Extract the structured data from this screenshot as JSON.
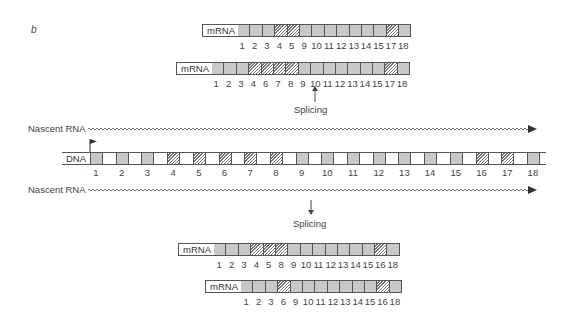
{
  "panel_label": "b",
  "labels": {
    "mrna": "mRNA",
    "dna": "DNA",
    "nascent_rna": "Nascent RNA",
    "splicing": "Splicing"
  },
  "colors": {
    "constitutive_exon": "#c8c8c8",
    "alternative_exon": "hatched",
    "outline": "#555555"
  },
  "dna": {
    "exons": [
      {
        "n": "1",
        "type": "solid"
      },
      {
        "n": "2",
        "type": "solid"
      },
      {
        "n": "3",
        "type": "solid"
      },
      {
        "n": "4",
        "type": "hatch"
      },
      {
        "n": "5",
        "type": "hatch"
      },
      {
        "n": "6",
        "type": "hatch"
      },
      {
        "n": "7",
        "type": "hatch"
      },
      {
        "n": "8",
        "type": "hatch"
      },
      {
        "n": "9",
        "type": "solid"
      },
      {
        "n": "10",
        "type": "solid"
      },
      {
        "n": "11",
        "type": "solid"
      },
      {
        "n": "12",
        "type": "solid"
      },
      {
        "n": "13",
        "type": "solid"
      },
      {
        "n": "14",
        "type": "solid"
      },
      {
        "n": "15",
        "type": "solid"
      },
      {
        "n": "16",
        "type": "hatch"
      },
      {
        "n": "17",
        "type": "hatch"
      },
      {
        "n": "18",
        "type": "solid"
      }
    ]
  },
  "mrnas": [
    {
      "id": "top-1",
      "exons": [
        "1",
        "2",
        "3",
        "4",
        "5",
        "9",
        "10",
        "11",
        "12",
        "13",
        "14",
        "15",
        "17",
        "18"
      ],
      "hatched": [
        "4",
        "5",
        "17"
      ]
    },
    {
      "id": "top-2",
      "exons": [
        "1",
        "2",
        "3",
        "4",
        "6",
        "7",
        "8",
        "9",
        "10",
        "11",
        "12",
        "13",
        "14",
        "15",
        "17",
        "18"
      ],
      "hatched": [
        "4",
        "6",
        "7",
        "8",
        "17"
      ]
    },
    {
      "id": "bottom-1",
      "exons": [
        "1",
        "2",
        "3",
        "4",
        "5",
        "8",
        "9",
        "10",
        "11",
        "12",
        "13",
        "14",
        "15",
        "16",
        "18"
      ],
      "hatched": [
        "4",
        "5",
        "8",
        "16"
      ]
    },
    {
      "id": "bottom-2",
      "exons": [
        "1",
        "2",
        "3",
        "6",
        "9",
        "10",
        "11",
        "12",
        "13",
        "14",
        "15",
        "16",
        "18"
      ],
      "hatched": [
        "6",
        "16"
      ]
    }
  ]
}
